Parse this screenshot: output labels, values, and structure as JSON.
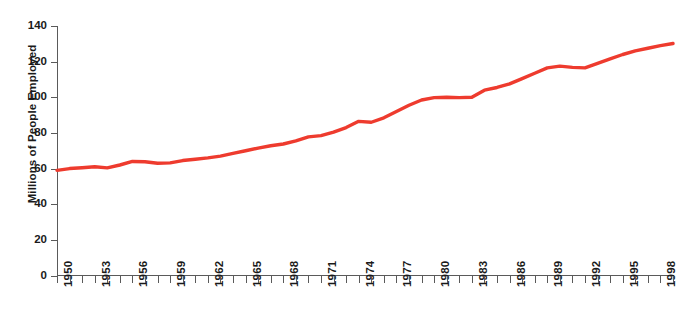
{
  "chart_data": {
    "type": "line",
    "title": "",
    "xlabel": "",
    "ylabel": "Millions of People Employed",
    "ylim": [
      0,
      140
    ],
    "xlim": [
      1950,
      1999
    ],
    "ytick_labels": [
      "0",
      "20",
      "40",
      "60",
      "80",
      "100",
      "120",
      "140"
    ],
    "yticks": [
      0,
      20,
      40,
      60,
      80,
      100,
      120,
      140
    ],
    "xtick_labels": [
      "1950",
      "1953",
      "1956",
      "1959",
      "1962",
      "1965",
      "1968",
      "1971",
      "1974",
      "1977",
      "1980",
      "1983",
      "1986",
      "1989",
      "1992",
      "1995",
      "1998"
    ],
    "xticks_minor_every": 1,
    "grid": false,
    "legend": "none",
    "line_color": "#ee3b2e",
    "axis_color": "#5a5a5a",
    "text_color": "#1a1a1a",
    "series": [
      {
        "name": "People Employed",
        "x": [
          1950,
          1951,
          1952,
          1953,
          1954,
          1955,
          1956,
          1957,
          1958,
          1959,
          1960,
          1961,
          1962,
          1963,
          1964,
          1965,
          1966,
          1967,
          1968,
          1969,
          1970,
          1971,
          1972,
          1973,
          1974,
          1975,
          1976,
          1977,
          1978,
          1979,
          1980,
          1981,
          1982,
          1983,
          1984,
          1985,
          1986,
          1987,
          1988,
          1989,
          1990,
          1991,
          1992,
          1993,
          1994,
          1995,
          1996,
          1997,
          1998,
          1999
        ],
        "values": [
          59.0,
          60.0,
          60.5,
          61.0,
          60.4,
          62.0,
          64.0,
          63.8,
          63.0,
          63.2,
          64.5,
          65.2,
          66.0,
          67.0,
          68.5,
          70.0,
          71.5,
          72.8,
          73.8,
          75.5,
          77.8,
          78.5,
          80.5,
          83.0,
          86.5,
          86.0,
          88.5,
          92.0,
          95.5,
          98.5,
          99.8,
          100.0,
          99.8,
          100.0,
          104.0,
          105.5,
          107.5,
          110.5,
          113.5,
          116.5,
          117.5,
          116.8,
          116.5,
          119.0,
          121.5,
          124.0,
          126.0,
          127.5,
          129.0,
          130.2
        ]
      }
    ]
  }
}
